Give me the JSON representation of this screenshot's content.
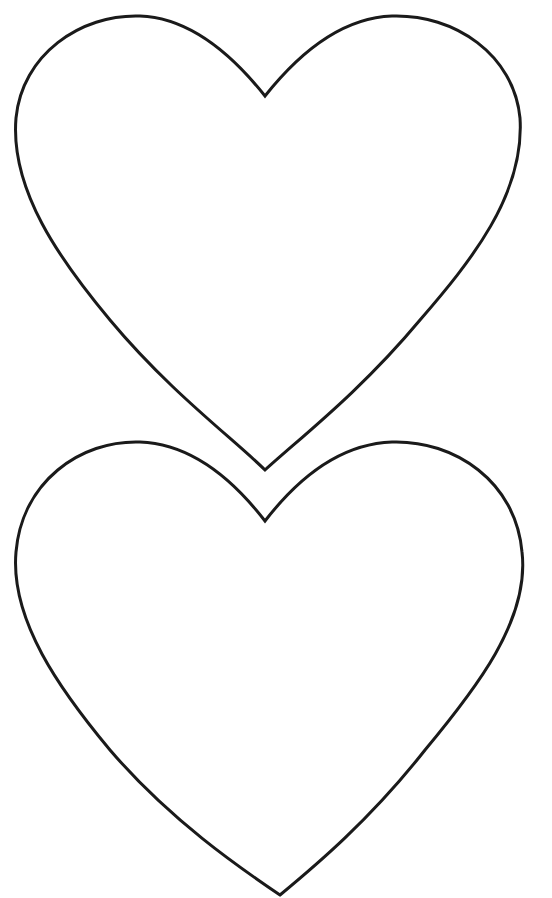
{
  "page": {
    "background": "#ffffff",
    "stroke_color": "#1a1a1a",
    "stroke_width": 3
  },
  "shapes": [
    {
      "name": "heart-outline-top",
      "kind": "heart"
    },
    {
      "name": "heart-outline-bottom",
      "kind": "heart"
    }
  ]
}
